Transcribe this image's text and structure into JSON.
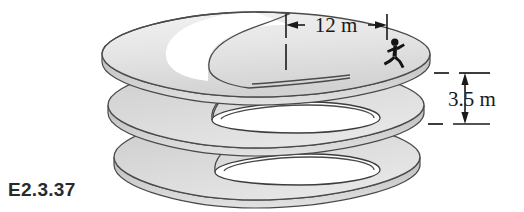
{
  "figure": {
    "label": "E2.3.37",
    "label_name": "figure-number-label",
    "background_color": "#ffffff"
  },
  "dimensions": [
    {
      "id": "horizontal-diameter",
      "value": "12 m",
      "orientation": "horizontal",
      "arrow_style": "double-inward",
      "position": "top"
    },
    {
      "id": "vertical-pitch",
      "value": "3.5 m",
      "orientation": "vertical",
      "arrow_style": "double-outward",
      "position": "right"
    }
  ],
  "annotations": {
    "runner_label": "running-person-icon",
    "runner_count": 1
  },
  "colors": {
    "surface_light": "#ebebeb",
    "surface_mid": "#d6d6d6",
    "surface_dark": "#c2c2c2",
    "edge_stroke": "#4a4a4a",
    "dimension_stroke": "#1a1a1a",
    "text": "#1a1a1a",
    "label_text": "#2a2a2a"
  },
  "helix": {
    "turns": 3,
    "turn_names": [
      "helix-turn-top",
      "helix-turn-middle",
      "helix-turn-bottom"
    ]
  }
}
